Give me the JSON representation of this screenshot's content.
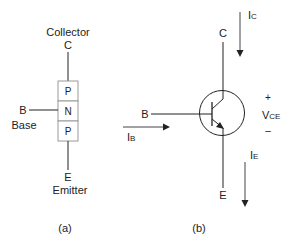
{
  "panel_a": {
    "caption": "(a)",
    "collector_label": "Collector",
    "collector_terminal": "C",
    "base_terminal": "B",
    "base_label": "Base",
    "emitter_terminal": "E",
    "emitter_label": "Emitter",
    "layers": [
      "P",
      "N",
      "P"
    ]
  },
  "panel_b": {
    "caption": "(b)",
    "collector_terminal": "C",
    "base_terminal": "B",
    "emitter_terminal": "E",
    "collector_current": {
      "main": "I",
      "sub": "C"
    },
    "base_current": {
      "main": "I",
      "sub": "B"
    },
    "emitter_current": {
      "main": "I",
      "sub": "E"
    },
    "voltage": {
      "main": "V",
      "sub": "CE",
      "plus": "+",
      "minus": "–"
    }
  },
  "colors": {
    "line": "#222222",
    "box_border": "#999999"
  }
}
